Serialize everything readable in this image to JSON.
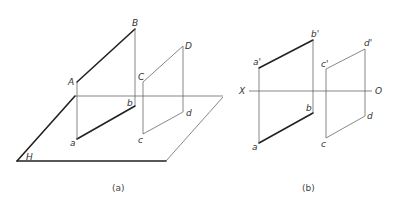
{
  "figure_a": {
    "caption": "(a)",
    "plane_label": "H",
    "points": {
      "A": "A",
      "B": "B",
      "C": "C",
      "D": "D",
      "a": "a",
      "b": "b",
      "c": "c",
      "d": "d"
    }
  },
  "figure_b": {
    "caption": "(b)",
    "axis": {
      "left": "X",
      "right": "O"
    },
    "points": {
      "a_prime": "a'",
      "b_prime": "b'",
      "c_prime": "c'",
      "d_prime": "d'",
      "a": "a",
      "b": "b",
      "c": "c",
      "d": "d"
    }
  }
}
